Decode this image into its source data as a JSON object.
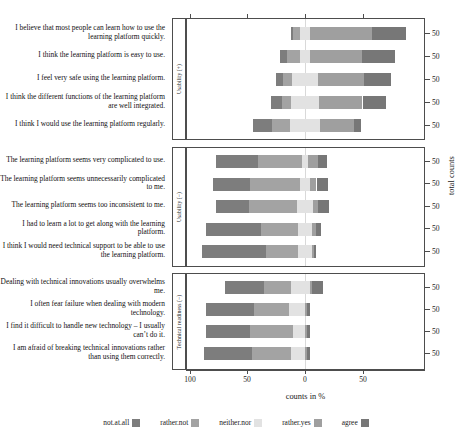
{
  "chart_data": {
    "type": "bar",
    "subtype": "diverging-stacked-likert",
    "title": "",
    "xlabel": "counts in %",
    "ylabel": "",
    "secondary_ylabel": "total counts",
    "xlim": [
      -100,
      100
    ],
    "xticks": [
      100,
      50,
      0,
      50
    ],
    "xtick_values": [
      -100,
      -50,
      0,
      50
    ],
    "grid": false,
    "legend_position": "bottom",
    "legend": [
      {
        "label": "not.at.all",
        "color": "#7d7d7d"
      },
      {
        "label": "rather.not",
        "color": "#a3a3a3"
      },
      {
        "label": "neither.nor",
        "color": "#e2e2e2"
      },
      {
        "label": "rather.yes",
        "color": "#9f9f9f"
      },
      {
        "label": "agree",
        "color": "#777777"
      }
    ],
    "categories": [
      "not.at.all",
      "rather.not",
      "neither.nor",
      "rather.yes",
      "agree"
    ],
    "panels": [
      {
        "strip_label": "Usability (+)",
        "items": [
          {
            "statement": "I believe that most people can learn how to use the learning platform quickly.",
            "total": 50,
            "total_label": "50",
            "percents": [
              2,
              6,
              8,
              54,
              30
            ],
            "neg_offset": -12
          },
          {
            "statement": "I think the learning platform is easy to use.",
            "total": 50,
            "total_label": "50",
            "percents": [
              6,
              12,
              8,
              46,
              28
            ],
            "neg_offset": -22
          },
          {
            "statement": "I feel very safe using the learning platform.",
            "total": 50,
            "total_label": "50",
            "percents": [
              6,
              8,
              22,
              40,
              24
            ],
            "neg_offset": -25
          },
          {
            "statement": "I think the different functions of the learning platform are well integrated.",
            "total": 50,
            "total_label": "50",
            "percents": [
              10,
              8,
              24,
              38,
              20
            ],
            "neg_offset": -30
          },
          {
            "statement": "I think I would use the learning platform regularly.",
            "total": 50,
            "total_label": "50",
            "percents": [
              16,
              16,
              26,
              30,
              6
            ],
            "neg_offset": -45
          }
        ]
      },
      {
        "strip_label": "Usability (−)",
        "items": [
          {
            "statement": "The learning platform seems very complicated to use.",
            "total": 50,
            "total_label": "50",
            "percents": [
              36,
              38,
              6,
              8,
              8
            ],
            "neg_offset": -77
          },
          {
            "statement": "The learning platform seems unnecessarily complicated to me.",
            "total": 50,
            "total_label": "50",
            "percents": [
              32,
              44,
              8,
              6,
              10
            ],
            "neg_offset": -80
          },
          {
            "statement": "The learning platform seems too inconsistent to me.",
            "total": 50,
            "total_label": "50",
            "percents": [
              28,
              42,
              14,
              4,
              10
            ],
            "neg_offset": -77
          },
          {
            "statement": "I had to learn a lot to get along with the learning platform.",
            "total": 50,
            "total_label": "50",
            "percents": [
              48,
              32,
              12,
              4,
              4
            ],
            "neg_offset": -86
          },
          {
            "statement": "I think I would need technical support to be able to use the learning platform.",
            "total": 50,
            "total_label": "50",
            "percents": [
              56,
              28,
              12,
              2,
              2
            ],
            "neg_offset": -90
          }
        ]
      },
      {
        "strip_label": "Technical readiness (−)",
        "items": [
          {
            "statement": "Dealing with technical innovations usually overwhelms me.",
            "total": 50,
            "total_label": "50",
            "percents": [
              34,
              24,
              16,
              2,
              10
            ],
            "neg_offset": -70
          },
          {
            "statement": "I often fear failure when dealing with modern technology.",
            "total": 50,
            "total_label": "50",
            "percents": [
              42,
              30,
              14,
              2,
              2
            ],
            "neg_offset": -86
          },
          {
            "statement": "I find it difficult to handle new technology – I usually can’t do it.",
            "total": 50,
            "total_label": "50",
            "percents": [
              38,
              38,
              10,
              2,
              2
            ],
            "neg_offset": -86
          },
          {
            "statement": "I am afraid of breaking technical innovations rather than using them correctly.",
            "total": 50,
            "total_label": "50",
            "percents": [
              42,
              34,
              12,
              2,
              2
            ],
            "neg_offset": -88
          }
        ]
      }
    ]
  },
  "axes": {
    "x_title": "counts in %",
    "x_tick_labels": [
      "100",
      "50",
      "0",
      "50"
    ],
    "right_axis_title": "total counts",
    "right_tick_label": "50"
  },
  "legend": {
    "items": [
      {
        "label": "not.at.all",
        "color": "#7d7d7d"
      },
      {
        "label": "rather.not",
        "color": "#a3a3a3"
      },
      {
        "label": "neither.nor",
        "color": "#e2e2e2"
      },
      {
        "label": "rather.yes",
        "color": "#9f9f9f"
      },
      {
        "label": "agree",
        "color": "#777777"
      }
    ]
  }
}
